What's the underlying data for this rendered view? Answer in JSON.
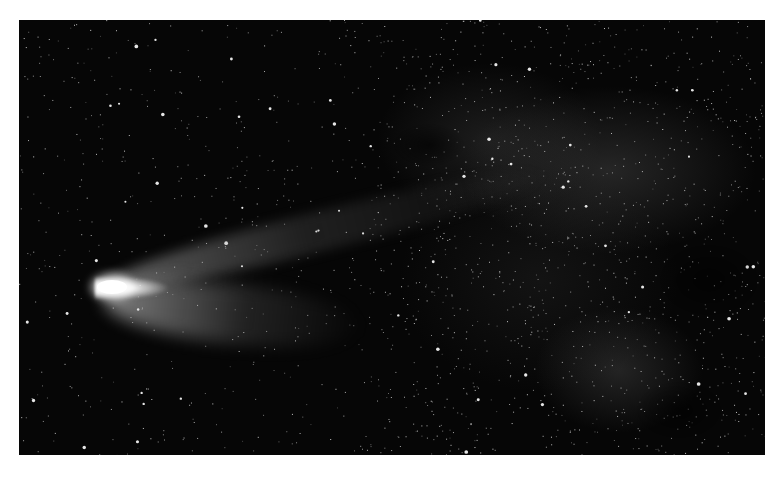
{
  "image": {
    "subject": "Comet with bright coma and long tail against the Milky Way star field",
    "frame": {
      "left": 19,
      "top": 20,
      "width": 746,
      "height": 435
    },
    "background_color": "#060606",
    "page_background": "#ffffff",
    "comet": {
      "head_position": {
        "x": 98,
        "y": 287
      },
      "head_color": "#ffffff",
      "tail_direction": "right, slightly upward"
    },
    "starfield": {
      "seed": 7,
      "count": 1800,
      "bright_count": 60,
      "star_color": "#ffffff"
    }
  }
}
